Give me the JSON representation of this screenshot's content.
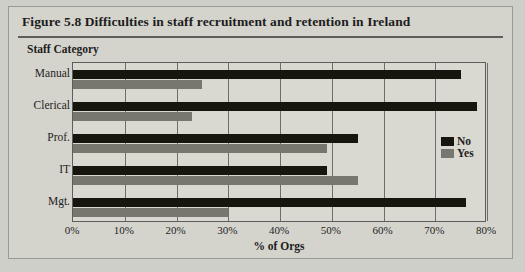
{
  "figure": {
    "title": "Figure 5.8  Difficulties in staff recruitment and retention in Ireland",
    "group_axis_title": "Staff Category"
  },
  "legend": {
    "position": "inside-right",
    "items": [
      {
        "label": "No",
        "color": "#16160f"
      },
      {
        "label": "Yes",
        "color": "#77776f"
      }
    ]
  },
  "chart_data": {
    "type": "bar",
    "orientation": "horizontal",
    "title": "Figure 5.8  Difficulties in staff recruitment and retention in Ireland",
    "xlabel": "% of Orgs",
    "ylabel": "Staff Category",
    "categories": [
      "Manual",
      "Clerical",
      "Prof.",
      "IT",
      "Mgt."
    ],
    "series": [
      {
        "name": "No",
        "color": "#16160f",
        "values": [
          75,
          78,
          55,
          49,
          76
        ]
      },
      {
        "name": "Yes",
        "color": "#77776f",
        "values": [
          25,
          23,
          49,
          55,
          30
        ]
      }
    ],
    "xlim": [
      0,
      80
    ],
    "xticks": [
      0,
      10,
      20,
      30,
      40,
      50,
      60,
      70,
      80
    ],
    "xtick_labels": [
      "0%",
      "10%",
      "20%",
      "30%",
      "40%",
      "50%",
      "60%",
      "70%",
      "80%"
    ],
    "grid": "vertical"
  }
}
